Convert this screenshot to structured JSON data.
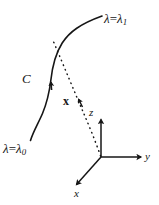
{
  "figure": {
    "background_color": "#ffffff",
    "ink_color": "#161616"
  },
  "labels": {
    "lambda_end": {
      "lhs": "λ",
      "eq": "=",
      "rhs": "λ",
      "sub": "1",
      "text": "λ=λ₁"
    },
    "lambda_start": {
      "lhs": "λ",
      "eq": "=",
      "rhs": "λ",
      "sub": "0",
      "text": "λ=λ₀"
    },
    "curve": {
      "text": "C"
    },
    "vector": {
      "text": "x"
    },
    "axis_z": {
      "text": "z"
    },
    "axis_y": {
      "text": "y"
    },
    "axis_x": {
      "text": "x"
    }
  },
  "geometry": {
    "curve_C": {
      "style": "solid",
      "stroke_width": 1.6,
      "path": "M 30.5 140.5 C 33.5 132 38.5 124 42.5 114 C 47 103 49.5 92 51 80 C 52.5 66 55 54 62 43 C 69 32 80 24 102 16",
      "direction_arrow": {
        "at_x": 47.5,
        "at_y": 80.5,
        "points": "up"
      }
    },
    "vector_x": {
      "style": "dotted",
      "stroke_width": 1.5,
      "dash": "0.5 4.2",
      "path": "M 101 157 C 95 140 88 124 82 110 C 74 92 64 68 53 41",
      "arrow_at": {
        "x": 78.5,
        "y": 100.5
      }
    },
    "axes": {
      "origin": {
        "x": 101,
        "y": 157
      },
      "z": {
        "to_x": 101,
        "to_y": 118,
        "label_side": "left"
      },
      "y": {
        "to_x": 143,
        "to_y": 157,
        "label_side": "right"
      },
      "x": {
        "to_x": 75,
        "to_y": 186,
        "label_side": "below"
      },
      "stroke_width": 1.5
    }
  }
}
